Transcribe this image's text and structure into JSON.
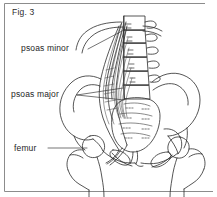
{
  "figure": {
    "caption": "Fig. 3",
    "background_color": "#ffffff",
    "ink_color": "#2b2b2b",
    "frame_color": "#8c8c8c",
    "leader_color": "#3a3a3a"
  },
  "labels": [
    {
      "id": "psoas-minor",
      "text": "psoas minor",
      "leader": "single line angling up-right to the upper muscle slip"
    },
    {
      "id": "psoas-major",
      "text": "psoas major",
      "leader": "two lines fanning right to the muscle belly"
    },
    {
      "id": "femur",
      "text": "femur",
      "leader": "single horizontal line to the left femur neck"
    }
  ],
  "structures": [
    "lumbar vertebral bodies",
    "transverse processes",
    "costal arch",
    "psoas minor",
    "psoas major",
    "iliac crest",
    "ilium",
    "sacrum",
    "sacral foramina",
    "pubic rami",
    "femoral head",
    "greater trochanter",
    "femoral shaft"
  ]
}
